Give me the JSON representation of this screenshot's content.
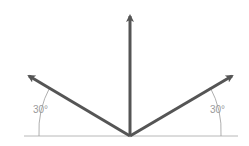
{
  "diagram": {
    "type": "vector-diagram",
    "origin": [
      130,
      137
    ],
    "baseline": {
      "x1": 24,
      "x2": 238,
      "y": 136,
      "color": "#b0b0b0"
    },
    "arrows": [
      {
        "name": "left",
        "tip": [
          27,
          74
        ],
        "angle_deg": 150
      },
      {
        "name": "vertical",
        "tip": [
          130,
          12
        ],
        "angle_deg": 90
      },
      {
        "name": "right",
        "tip": [
          235,
          74
        ],
        "angle_deg": 30
      }
    ],
    "arrow_color": "#555555",
    "angle_labels": {
      "left": "30°",
      "right": "30°"
    }
  }
}
